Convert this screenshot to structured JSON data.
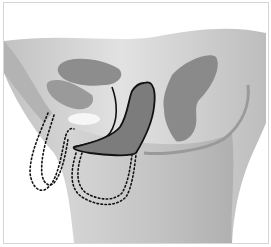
{
  "figure": {
    "type": "anatomical-illustration",
    "view": "sagittal pelvic cross-section",
    "style": "grayscale with black outlined device and dotted outlines",
    "colors": {
      "background": "#ffffff",
      "body_light": "#c9c9c9",
      "body_mid": "#b5b5b5",
      "organ_dark": "#8a8a8a",
      "device_fill": "#7a7a7a",
      "outline": "#111111",
      "highlight": "#f4f4f4",
      "border": "#d6d6d6"
    },
    "elements": [
      {
        "name": "pelvic-body",
        "shade": "light gray"
      },
      {
        "name": "bladder",
        "shade": "dark gray"
      },
      {
        "name": "uterus",
        "shade": "dark gray"
      },
      {
        "name": "rectum-curve",
        "shade": "mid gray"
      },
      {
        "name": "device-outline",
        "shade": "dark gray with black outline"
      },
      {
        "name": "dotted-outline-left",
        "style": "dotted"
      },
      {
        "name": "dotted-outline-lower",
        "style": "dotted"
      }
    ]
  }
}
